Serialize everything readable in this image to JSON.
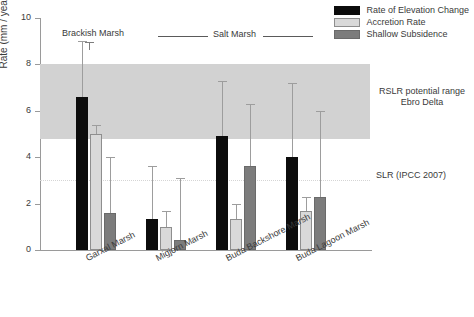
{
  "chart_data": {
    "type": "bar",
    "title": "",
    "xlabel": "",
    "ylabel": "Rate (mm / year)",
    "ylim": [
      0,
      10
    ],
    "yticks": [
      0,
      2,
      4,
      6,
      8,
      10
    ],
    "grid": false,
    "legend_position": "top-right",
    "categories": [
      "Garxal Marsh",
      "Migjorn Marsh",
      "Buda Backshore Marsh",
      "Buda Lagoon Marsh"
    ],
    "series": [
      {
        "name": "Rate of Elevation Change",
        "color": "#0c0c0c",
        "values": [
          6.6,
          1.35,
          4.9,
          4.0
        ],
        "error_upper": [
          9.0,
          3.6,
          7.3,
          7.2
        ]
      },
      {
        "name": "Accretion Rate",
        "color": "#d9d9d9",
        "values": [
          5.0,
          1.0,
          1.35,
          1.7
        ],
        "error_upper": [
          5.4,
          1.7,
          2.0,
          2.3
        ]
      },
      {
        "name": "Shallow Subsidence",
        "color": "#7c7c7c",
        "values": [
          1.6,
          0.45,
          3.6,
          2.3
        ],
        "error_upper": [
          4.0,
          3.1,
          6.3,
          6.0
        ]
      }
    ],
    "bands": [
      {
        "label": "RSLR potential range Ebro Delta",
        "y_min": 4.8,
        "y_max": 8.0,
        "color": "#d2d2d2"
      }
    ],
    "reference_lines": [
      {
        "label": "SLR (IPCC 2007)",
        "y": 3.0,
        "style": "dotted",
        "color": "#d5d5d5"
      }
    ],
    "annotations": {
      "brackish_group": "Brackish Marsh",
      "salt_group": "Salt Marsh",
      "band_label_line1": "RSLR potential range",
      "band_label_line2": "Ebro Delta",
      "slr_label": "SLR (IPCC 2007)"
    }
  }
}
